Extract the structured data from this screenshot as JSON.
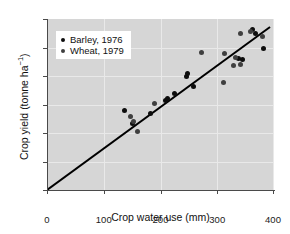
{
  "chart_data": {
    "type": "scatter",
    "title": "",
    "xlabel": "Crop water use (mm)",
    "ylabel": "Crop yield (tonne ha⁻¹)",
    "ylabel_base": "Crop yield (tonne ha",
    "ylabel_sup": "−1",
    "ylabel_tail": ")",
    "xlim": [
      0,
      400
    ],
    "ylim": [
      0,
      6
    ],
    "xticks": [
      0,
      100,
      200,
      300,
      400
    ],
    "yticks": [
      0,
      1,
      2,
      3,
      4,
      5,
      6
    ],
    "xtick_labels": [
      "0",
      "100",
      "200",
      "300",
      "400"
    ],
    "ytick_labels": [
      "0",
      "1",
      "2",
      "3",
      "4",
      "5",
      "6"
    ],
    "grid": true,
    "grid_color": "#e9e9e9",
    "plot_background": "#d6d6d6",
    "legend_position": "upper-left",
    "series": [
      {
        "name": "Barley, 1976",
        "color": "#0d0d0d",
        "marker": "circle",
        "points": [
          [
            137,
            2.8
          ],
          [
            150,
            2.33
          ],
          [
            182,
            2.68
          ],
          [
            208,
            3.14
          ],
          [
            212,
            3.2
          ],
          [
            224,
            3.38
          ],
          [
            246,
            4.0
          ],
          [
            247,
            4.08
          ],
          [
            259,
            3.64
          ],
          [
            337,
            4.62
          ],
          [
            345,
            4.58
          ],
          [
            362,
            5.62
          ],
          [
            367,
            5.5
          ],
          [
            382,
            4.96
          ]
        ]
      },
      {
        "name": "Wheat, 1979",
        "color": "#3f3f3f",
        "marker": "circle",
        "points": [
          [
            148,
            2.57
          ],
          [
            152,
            2.42
          ],
          [
            160,
            2.07
          ],
          [
            189,
            3.02
          ],
          [
            272,
            4.82
          ],
          [
            311,
            3.76
          ],
          [
            313,
            4.8
          ],
          [
            328,
            4.38
          ],
          [
            333,
            4.66
          ],
          [
            341,
            4.4
          ],
          [
            341,
            5.48
          ],
          [
            358,
            5.55
          ],
          [
            379,
            5.38
          ]
        ]
      }
    ],
    "trendline": {
      "type": "linear-through-origin",
      "x_start": 0,
      "y_start": 0,
      "x_end": 393,
      "y_end": 5.72,
      "color": "#000000",
      "width": 2
    }
  },
  "legend": {
    "items": [
      {
        "label": "Barley, 1976",
        "color": "#0d0d0d"
      },
      {
        "label": "Wheat, 1979",
        "color": "#3f3f3f"
      }
    ]
  }
}
